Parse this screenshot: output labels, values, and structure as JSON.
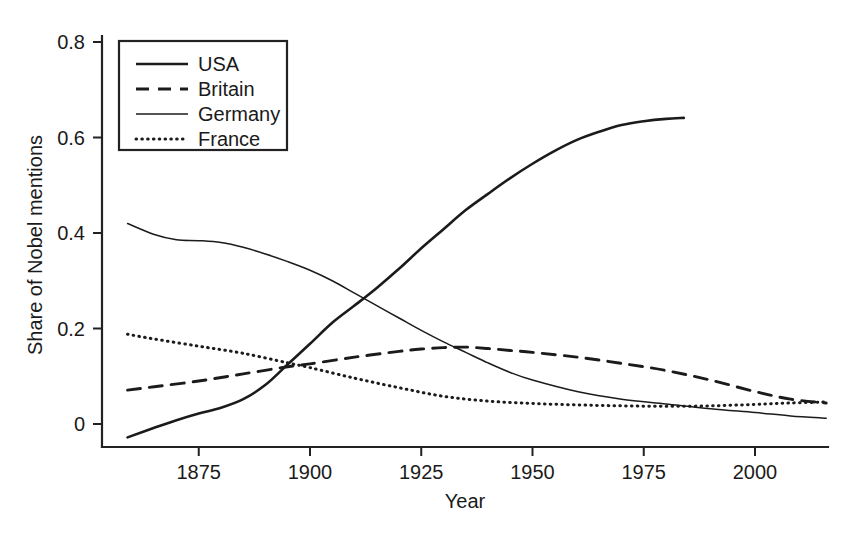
{
  "chart_data": {
    "type": "line",
    "title": "",
    "xlabel": "Year",
    "ylabel": "Share of Nobel mentions",
    "xlim": [
      1859,
      2016
    ],
    "ylim": [
      -0.045,
      0.84
    ],
    "grid": false,
    "legend_position": "top-left",
    "xticks": [
      1875,
      1900,
      1925,
      1950,
      1975,
      2000
    ],
    "xtick_labels": [
      "1875",
      "1900",
      "1925",
      "1950",
      "1975",
      "2000"
    ],
    "yticks": [
      0,
      0.2,
      0.4,
      0.6,
      0.8
    ],
    "ytick_labels": [
      "0",
      "0.2",
      "0.4",
      "0.6",
      "0.8"
    ],
    "series": [
      {
        "name": "USA",
        "style": "solid",
        "color": "#1b1b1b",
        "x": [
          1859,
          1865,
          1870,
          1875,
          1880,
          1885,
          1890,
          1895,
          1900,
          1905,
          1910,
          1915,
          1920,
          1925,
          1930,
          1935,
          1940,
          1945,
          1950,
          1955,
          1960,
          1965,
          1970,
          1975,
          1980,
          1984
        ],
        "values": [
          -0.028,
          -0.008,
          0.008,
          0.022,
          0.034,
          0.052,
          0.082,
          0.125,
          0.168,
          0.212,
          0.248,
          0.285,
          0.325,
          0.368,
          0.408,
          0.448,
          0.482,
          0.515,
          0.545,
          0.572,
          0.595,
          0.612,
          0.626,
          0.634,
          0.639,
          0.641
        ]
      },
      {
        "name": "Britain",
        "style": "dashed",
        "color": "#1b1b1b",
        "x": [
          1859,
          1865,
          1875,
          1885,
          1895,
          1900,
          1910,
          1920,
          1925,
          1930,
          1935,
          1940,
          1945,
          1950,
          1960,
          1970,
          1980,
          1990,
          2000,
          2008,
          2016
        ],
        "values": [
          0.071,
          0.078,
          0.09,
          0.105,
          0.12,
          0.126,
          0.14,
          0.152,
          0.157,
          0.16,
          0.161,
          0.158,
          0.154,
          0.15,
          0.14,
          0.127,
          0.112,
          0.092,
          0.068,
          0.052,
          0.044
        ]
      },
      {
        "name": "Germany",
        "style": "thin-solid",
        "color": "#1b1b1b",
        "x": [
          1859,
          1865,
          1870,
          1875,
          1880,
          1885,
          1890,
          1895,
          1900,
          1905,
          1910,
          1915,
          1920,
          1925,
          1930,
          1935,
          1940,
          1945,
          1950,
          1960,
          1970,
          1980,
          1990,
          2000,
          2008,
          2016
        ],
        "values": [
          0.42,
          0.397,
          0.386,
          0.384,
          0.38,
          0.37,
          0.356,
          0.34,
          0.322,
          0.3,
          0.274,
          0.248,
          0.222,
          0.196,
          0.172,
          0.15,
          0.128,
          0.108,
          0.092,
          0.068,
          0.052,
          0.042,
          0.032,
          0.024,
          0.017,
          0.012
        ]
      },
      {
        "name": "France",
        "style": "dotted",
        "color": "#1b1b1b",
        "x": [
          1859,
          1865,
          1875,
          1885,
          1895,
          1900,
          1910,
          1920,
          1930,
          1940,
          1950,
          1960,
          1970,
          1980,
          1990,
          2000,
          2008,
          2016
        ],
        "values": [
          0.188,
          0.178,
          0.163,
          0.148,
          0.128,
          0.118,
          0.096,
          0.076,
          0.058,
          0.048,
          0.043,
          0.04,
          0.038,
          0.037,
          0.038,
          0.041,
          0.044,
          0.046
        ]
      }
    ],
    "legend": [
      {
        "label": "USA",
        "style": "solid"
      },
      {
        "label": "Britain",
        "style": "dashed"
      },
      {
        "label": "Germany",
        "style": "thin-solid"
      },
      {
        "label": "France",
        "style": "dotted"
      }
    ]
  }
}
